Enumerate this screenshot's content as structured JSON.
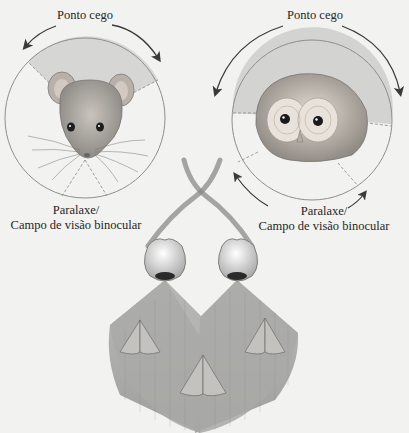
{
  "figure": {
    "panels": [
      {
        "id": "mouse",
        "animal": "mouse",
        "top_label": "Ponto cego",
        "bottom_label_line1": "Paralaxe/",
        "bottom_label_line2": "Campo de visão binocular"
      },
      {
        "id": "owl",
        "animal": "owl",
        "top_label": "Ponto cego",
        "bottom_label_line1": "Paralaxe/",
        "bottom_label_line2": "Campo de visão binocular"
      }
    ],
    "bottom_illustration": {
      "description": "two eyes with crossing optic nerves and overlapping fields of view containing three moths",
      "moth_count": 3
    },
    "colors": {
      "background": "#f2f2f1",
      "shaded_field": "#cfcfcf",
      "circle_stroke": "#8a8a8a",
      "arrow": "#3a3a3a",
      "fan_fill": "#a8a8a8"
    }
  }
}
